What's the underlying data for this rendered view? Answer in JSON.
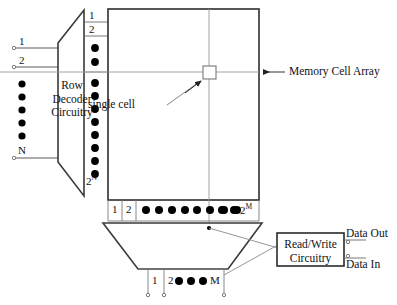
{
  "diagram": {
    "colors": {
      "line": "#4a4a4a",
      "heavy_line": "#3a3a3a",
      "text": "#111111",
      "background": "#ffffff",
      "dot": "#000000"
    },
    "blocks": {
      "row_decoder": {
        "name": "row-decoder",
        "line1": "Row",
        "line2": "Decoder",
        "line3": "Circuitry"
      },
      "memory_array": {
        "name": "memory-cell-array",
        "label": "Memory Cell Array"
      },
      "column_decoder": {
        "name": "column-decoder",
        "label": ""
      },
      "read_write": {
        "name": "read-write-circuitry",
        "line1": "Read/Write",
        "line2": "Circuitry"
      }
    },
    "annotations": {
      "single_cell": "single cell",
      "memory_cell_array": "Memory Cell Array",
      "data_out": "Data Out",
      "data_in": "Data In"
    },
    "address_inputs": {
      "name": "row-address-inputs",
      "first": "1",
      "second": "2",
      "last": "N",
      "dot_count": 5
    },
    "word_lines": {
      "name": "word-lines",
      "first": "1",
      "second": "2",
      "last_base": "2",
      "last_exp": "N",
      "dots_upper": 2,
      "dots_lower": 8
    },
    "bit_lines": {
      "name": "bit-lines",
      "first": "1",
      "second": "2",
      "last_base": "2",
      "last_exp": "M",
      "dots_main": 8,
      "dots_tail": 2
    },
    "column_address_inputs": {
      "name": "column-address-inputs",
      "first": "1",
      "second": "2",
      "last": "M",
      "dot_count": 3
    }
  }
}
